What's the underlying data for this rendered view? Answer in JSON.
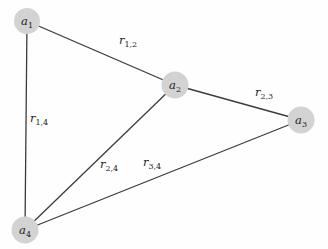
{
  "diagram": {
    "colors": {
      "background": "#fefefe",
      "node_fill": "#d3d3d3",
      "edge_stroke": "#3c3c3c",
      "label_text": "#1c1c1c"
    },
    "nodes": [
      {
        "id": "a1",
        "label_base": "a",
        "label_sub": "1",
        "x": 27,
        "y": 21,
        "r": 13
      },
      {
        "id": "a2",
        "label_base": "a",
        "label_sub": "2",
        "x": 175,
        "y": 85,
        "r": 13.5
      },
      {
        "id": "a3",
        "label_base": "a",
        "label_sub": "3",
        "x": 301,
        "y": 120,
        "r": 13.5
      },
      {
        "id": "a4",
        "label_base": "a",
        "label_sub": "4",
        "x": 25,
        "y": 230,
        "r": 13.5
      }
    ],
    "edges": [
      {
        "from": "a1",
        "to": "a2",
        "label_base": "r",
        "label_sub": "1,2",
        "label_x": 128,
        "label_y": 44
      },
      {
        "from": "a1",
        "to": "a4",
        "label_base": "r",
        "label_sub": "1,4",
        "label_x": 39,
        "label_y": 122
      },
      {
        "from": "a2",
        "to": "a3",
        "label_base": "r",
        "label_sub": "2,3",
        "label_x": 264,
        "label_y": 96
      },
      {
        "from": "a2",
        "to": "a4",
        "label_base": "r",
        "label_sub": "2,4",
        "label_x": 109,
        "label_y": 168
      },
      {
        "from": "a3",
        "to": "a4",
        "label_base": "r",
        "label_sub": "3,4",
        "label_x": 152,
        "label_y": 166
      }
    ]
  }
}
